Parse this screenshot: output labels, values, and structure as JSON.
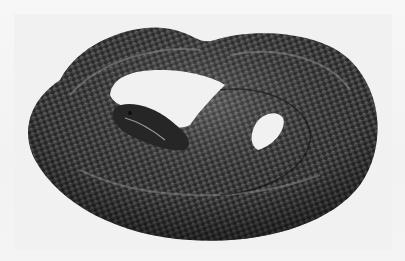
{
  "image": {
    "subject": "coiled snake",
    "style": "grayscale photograph",
    "background_color": "#f2f2f2",
    "snake_color_dark": "#1e1e1e",
    "snake_color_mid": "#4a4a4a",
    "highlight_color": "#bdbdbd"
  }
}
